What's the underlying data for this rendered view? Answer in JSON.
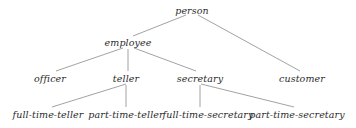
{
  "diagram": {
    "type": "isa-specialization-hierarchy",
    "line_color": "#8a8a8a",
    "text_color": "#2b2b2b",
    "nodes": [
      {
        "id": "person",
        "label": "person",
        "level": 0,
        "x": 192,
        "y": 10
      },
      {
        "id": "employee",
        "label": "employee",
        "level": 1,
        "x": 128,
        "y": 42
      },
      {
        "id": "officer",
        "label": "officer",
        "level": 2,
        "x": 50,
        "y": 78
      },
      {
        "id": "teller",
        "label": "teller",
        "level": 2,
        "x": 126,
        "y": 78
      },
      {
        "id": "secretary",
        "label": "secretary",
        "level": 2,
        "x": 200,
        "y": 78
      },
      {
        "id": "customer",
        "label": "customer",
        "level": 2,
        "x": 302,
        "y": 78
      },
      {
        "id": "full-time-teller",
        "label": "full-time-teller",
        "level": 3,
        "x": 48,
        "y": 114
      },
      {
        "id": "part-time-teller",
        "label": "part-time-teller",
        "level": 3,
        "x": 126,
        "y": 114
      },
      {
        "id": "full-time-secretary",
        "label": "full-time-secretary",
        "level": 3,
        "x": 208,
        "y": 114
      },
      {
        "id": "part-time-secretary",
        "label": "part-time-secretary",
        "level": 3,
        "x": 297,
        "y": 114
      }
    ],
    "edges": [
      {
        "from": "person",
        "to": "employee",
        "x1": 186,
        "y1": 15,
        "x2": 133,
        "y2": 36
      },
      {
        "from": "person",
        "to": "customer",
        "x1": 198,
        "y1": 15,
        "x2": 300,
        "y2": 71
      },
      {
        "from": "employee",
        "to": "officer",
        "x1": 123,
        "y1": 48,
        "x2": 56,
        "y2": 71
      },
      {
        "from": "employee",
        "to": "teller",
        "x1": 128,
        "y1": 49,
        "x2": 128,
        "y2": 71
      },
      {
        "from": "employee",
        "to": "secretary",
        "x1": 134,
        "y1": 48,
        "x2": 196,
        "y2": 71
      },
      {
        "from": "teller",
        "to": "full-time-teller",
        "x1": 126,
        "y1": 84,
        "x2": 52,
        "y2": 107
      },
      {
        "from": "teller",
        "to": "part-time-teller",
        "x1": 126,
        "y1": 85,
        "x2": 126,
        "y2": 107
      },
      {
        "from": "secretary",
        "to": "full-time-secretary",
        "x1": 200,
        "y1": 85,
        "x2": 200,
        "y2": 107
      },
      {
        "from": "secretary",
        "to": "part-time-secretary",
        "x1": 201,
        "y1": 84,
        "x2": 294,
        "y2": 107
      }
    ]
  }
}
